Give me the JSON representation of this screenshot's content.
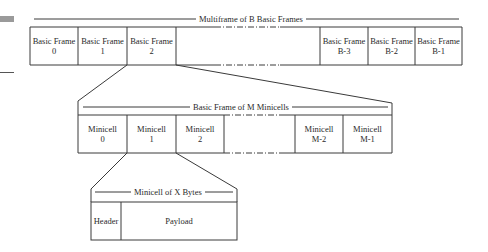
{
  "multiframe": {
    "title": "Multiframe of B Basic Frames",
    "frames": [
      {
        "line1": "Basic Frame",
        "line2": "0"
      },
      {
        "line1": "Basic Frame",
        "line2": "1"
      },
      {
        "line1": "Basic Frame",
        "line2": "2"
      },
      {
        "line1": "Basic Frame",
        "line2": "B-3"
      },
      {
        "line1": "Basic Frame",
        "line2": "B-2"
      },
      {
        "line1": "Basic Frame",
        "line2": "B-1"
      }
    ]
  },
  "basic_frame": {
    "title": "Basic Frame of M Minicells",
    "cells": [
      {
        "line1": "Minicell",
        "line2": "0"
      },
      {
        "line1": "Minicell",
        "line2": "1"
      },
      {
        "line1": "Minicell",
        "line2": "2"
      },
      {
        "line1": "Minicell",
        "line2": "M-2"
      },
      {
        "line1": "Minicell",
        "line2": "M-1"
      }
    ]
  },
  "minicell": {
    "title": "Minicell of X Bytes",
    "fields": [
      {
        "label": "Header"
      },
      {
        "label": "Payload"
      }
    ]
  },
  "colors": {
    "line": "#3a3a3a",
    "background": "#ffffff",
    "artifact": "#9a9a9a"
  }
}
